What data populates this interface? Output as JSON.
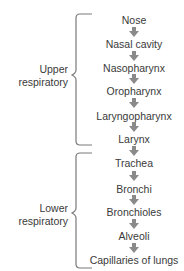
{
  "diagram": {
    "title": "",
    "groups": [
      {
        "label_line1": "Upper",
        "label_line2": "respiratory"
      },
      {
        "label_line1": "Lower",
        "label_line2": "respiratory"
      }
    ],
    "nodes": [
      {
        "label": "Nose"
      },
      {
        "label": "Nasal cavity"
      },
      {
        "label": "Nasopharynx"
      },
      {
        "label": "Oropharynx"
      },
      {
        "label": "Laryngopharynx"
      },
      {
        "label": "Larynx"
      },
      {
        "label": "Trachea"
      },
      {
        "label": "Bronchi"
      },
      {
        "label": "Bronchioles"
      },
      {
        "label": "Alveoli"
      },
      {
        "label": "Capillaries of lungs"
      }
    ],
    "colors": {
      "text": "#3a3a3a",
      "arrow": "#8a8a8a",
      "brace": "#7a7a7a"
    }
  }
}
